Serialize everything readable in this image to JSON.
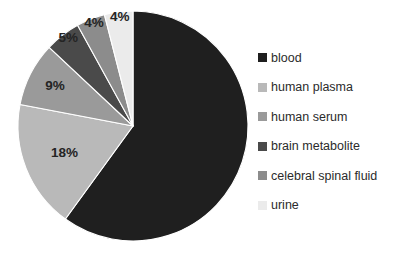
{
  "chart_data": {
    "type": "pie",
    "title": "",
    "subtitle": "",
    "xlabel": "",
    "ylabel": "",
    "grid": false,
    "legend_position": "right",
    "start_angle_deg": 0,
    "direction": "clockwise",
    "categories": [
      "blood",
      "human plasma",
      "human serum",
      "brain metabolite",
      "celebral spinal fluid",
      "urine"
    ],
    "values": [
      60,
      18,
      9,
      5,
      4,
      4
    ],
    "value_unit": "%",
    "data_labels": [
      "",
      "18%",
      "9%",
      "5%",
      "4%",
      "4%"
    ],
    "colors": [
      "#1f1f1f",
      "#b9b9b9",
      "#9a9a9a",
      "#4a4a4a",
      "#8c8c8c",
      "#ebebeb"
    ],
    "slices": [
      {
        "label": "blood",
        "value": 60,
        "data_label": "",
        "color": "#1f1f1f"
      },
      {
        "label": "human plasma",
        "value": 18,
        "data_label": "18%",
        "color": "#b9b9b9"
      },
      {
        "label": "human serum",
        "value": 9,
        "data_label": "9%",
        "color": "#9a9a9a"
      },
      {
        "label": "brain metabolite",
        "value": 5,
        "data_label": "5%",
        "color": "#4a4a4a"
      },
      {
        "label": "celebral spinal fluid",
        "value": 4,
        "data_label": "4%",
        "color": "#8c8c8c"
      },
      {
        "label": "urine",
        "value": 4,
        "data_label": "4%",
        "color": "#ebebeb"
      }
    ]
  },
  "legend": {
    "items": [
      {
        "label": "blood",
        "color": "#1f1f1f"
      },
      {
        "label": "human plasma",
        "color": "#b9b9b9"
      },
      {
        "label": "human serum",
        "color": "#9a9a9a"
      },
      {
        "label": "brain metabolite",
        "color": "#4a4a4a"
      },
      {
        "label": "celebral spinal fluid",
        "color": "#8c8c8c"
      },
      {
        "label": "urine",
        "color": "#ebebeb"
      }
    ]
  },
  "canvas": {
    "background": "#ffffff",
    "pie_center_x": 133,
    "pie_center_y": 126,
    "pie_radius": 115
  }
}
